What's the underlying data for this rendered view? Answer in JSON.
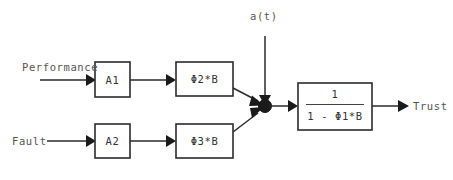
{
  "diagram": {
    "accent_color": "#2b2b2b",
    "background_color": "#ffffff",
    "inputs": [
      {
        "id": "performance",
        "label": "Performance"
      },
      {
        "id": "fault",
        "label": "Fault"
      },
      {
        "id": "at",
        "label": "a(t)"
      }
    ],
    "outputs": [
      {
        "id": "trust",
        "label": "Trust"
      }
    ],
    "blocks": [
      {
        "id": "a1",
        "label": "A1"
      },
      {
        "id": "phi2b",
        "label": "Φ2*B"
      },
      {
        "id": "a2",
        "label": "A2"
      },
      {
        "id": "phi3b",
        "label": "Φ3*B"
      }
    ],
    "transfer_block": {
      "id": "feedback",
      "numerator": "1",
      "denominator": "1 - Φ1*B"
    },
    "junction": {
      "id": "summing-junction",
      "label": ""
    }
  }
}
